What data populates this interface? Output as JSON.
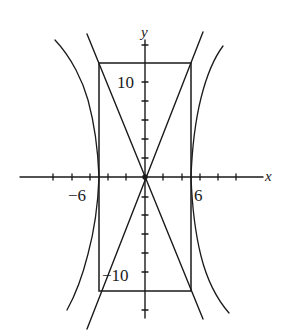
{
  "figure": {
    "axes": {
      "x_label": "x",
      "y_label": "y"
    },
    "tick_labels": {
      "x_neg": "−6",
      "x_pos": "6",
      "y_pos": "10",
      "y_neg": "−10"
    },
    "rectangle": {
      "x_min": -6,
      "x_max": 6,
      "y_min": -12,
      "y_max": 12
    },
    "asymptotes": [
      "y = 2x",
      "y = -2x"
    ],
    "colors": {
      "ink": "#1a1a1a",
      "background": "#ffffff"
    }
  }
}
